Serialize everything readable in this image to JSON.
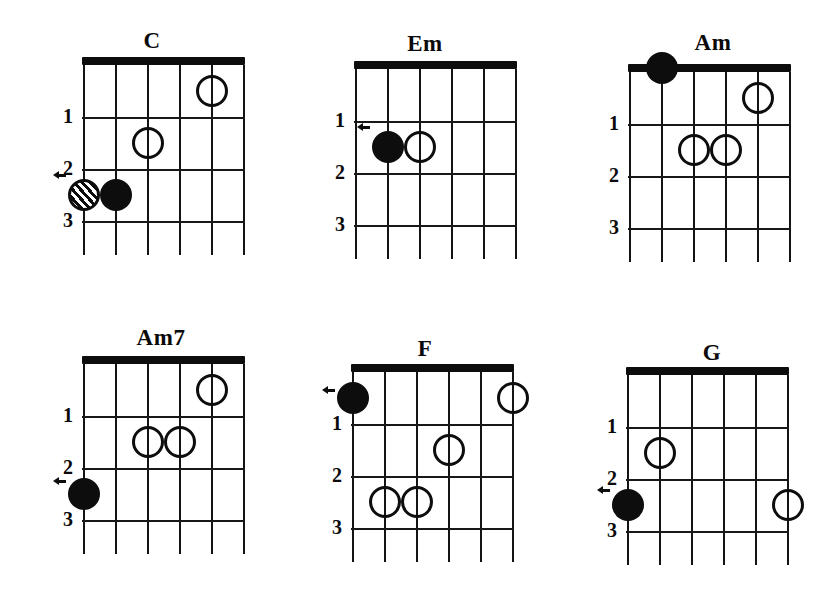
{
  "sheet": {
    "title": "Guitar Chord Diagrams",
    "background_color": "#ffffff",
    "ink_color": "#0d0d0d",
    "string_count": 6,
    "fret_count": 3
  },
  "legend": {
    "filled_marker": "filled-dot",
    "open_marker": "open-circle",
    "hatched_marker": "hatched-circle",
    "arrow_marker": "arrow-indicator"
  },
  "chords": [
    {
      "id": "c",
      "name": "C",
      "title_x": 152,
      "title_y": 28,
      "grid_x": 83,
      "grid_y": 65,
      "fret_labels": [
        "1",
        "2",
        "3"
      ],
      "markers": [
        {
          "type": "open",
          "string": 5,
          "fret": 1
        },
        {
          "type": "open",
          "string": 3,
          "fret": 2
        },
        {
          "type": "hatched",
          "string": 1,
          "fret": 3
        },
        {
          "type": "filled",
          "string": 2,
          "fret": 3
        }
      ],
      "arrows": [
        {
          "string": 1,
          "fret": 2.62
        }
      ]
    },
    {
      "id": "em",
      "name": "Em",
      "title_x": 425,
      "title_y": 31,
      "grid_x": 355,
      "grid_y": 69,
      "fret_labels": [
        "1",
        "2",
        "3"
      ],
      "markers": [
        {
          "type": "filled",
          "string": 2,
          "fret": 2
        },
        {
          "type": "open",
          "string": 3,
          "fret": 2
        }
      ],
      "arrows": [
        {
          "string": 2,
          "fret": 1.62
        }
      ]
    },
    {
      "id": "am",
      "name": "Am",
      "title_x": 713,
      "title_y": 30,
      "grid_x": 629,
      "grid_y": 72,
      "fret_labels": [
        "1",
        "2",
        "3"
      ],
      "markers": [
        {
          "type": "open",
          "string": 5,
          "fret": 1
        },
        {
          "type": "open",
          "string": 3,
          "fret": 2
        },
        {
          "type": "open",
          "string": 4,
          "fret": 2
        },
        {
          "type": "filled",
          "string": 2,
          "fret": 0
        }
      ],
      "arrows": [
        {
          "string": 2,
          "fret": 0
        }
      ]
    },
    {
      "id": "am7",
      "name": "Am7",
      "title_x": 161,
      "title_y": 325,
      "grid_x": 83,
      "grid_y": 364,
      "fret_labels": [
        "1",
        "2",
        "3"
      ],
      "markers": [
        {
          "type": "open",
          "string": 5,
          "fret": 1
        },
        {
          "type": "open",
          "string": 3,
          "fret": 2
        },
        {
          "type": "open",
          "string": 4,
          "fret": 2
        },
        {
          "type": "filled",
          "string": 1,
          "fret": 3
        }
      ],
      "arrows": [
        {
          "string": 1,
          "fret": 2.75
        }
      ]
    },
    {
      "id": "f",
      "name": "F",
      "title_x": 425,
      "title_y": 336,
      "grid_x": 352,
      "grid_y": 372,
      "fret_labels": [
        "1",
        "2",
        "3"
      ],
      "markers": [
        {
          "type": "filled",
          "string": 1,
          "fret": 1
        },
        {
          "type": "open",
          "string": 6,
          "fret": 1
        },
        {
          "type": "open",
          "string": 4,
          "fret": 2
        },
        {
          "type": "open",
          "string": 2,
          "fret": 3
        },
        {
          "type": "open",
          "string": 3,
          "fret": 3
        }
      ],
      "arrows": [
        {
          "string": 1,
          "fret": 0.85
        }
      ]
    },
    {
      "id": "g",
      "name": "G",
      "title_x": 712,
      "title_y": 340,
      "grid_x": 627,
      "grid_y": 375,
      "fret_labels": [
        "1",
        "2",
        "3"
      ],
      "markers": [
        {
          "type": "open",
          "string": 2,
          "fret": 2
        },
        {
          "type": "filled",
          "string": 1,
          "fret": 3
        },
        {
          "type": "open",
          "string": 6,
          "fret": 3
        }
      ],
      "arrows": [
        {
          "string": 1,
          "fret": 2.72
        }
      ]
    }
  ],
  "geometry": {
    "string_spacing": 32,
    "fret_spacing": 52,
    "tail_length": 34,
    "nut_height": 8,
    "marker_diameter": 32,
    "fretnum_offset_x": 30
  }
}
